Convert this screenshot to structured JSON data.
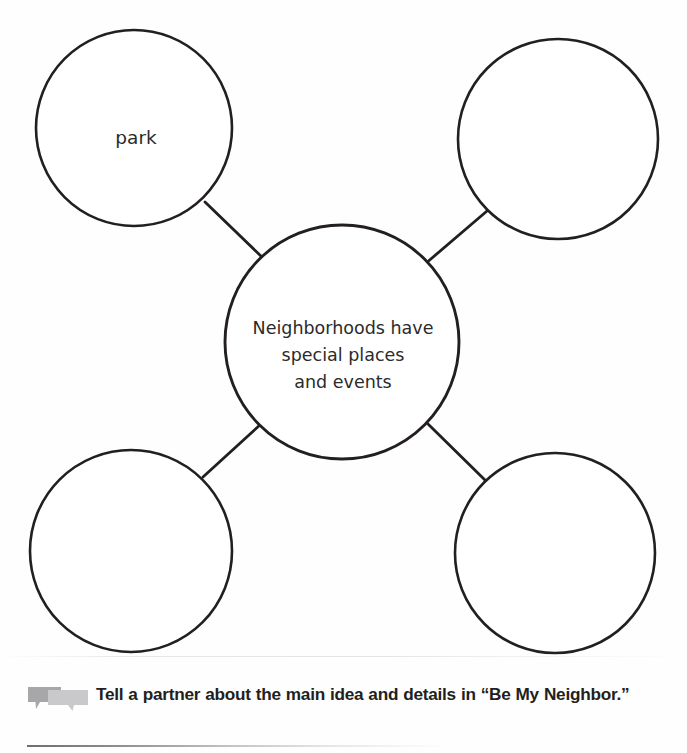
{
  "page": {
    "background_color": "#fefefe",
    "ink_color": "#231f20"
  },
  "diagram": {
    "type": "bubble-map",
    "center": {
      "id": "center-bubble",
      "lines": [
        "Neighborhoods have",
        "special places",
        "and events"
      ],
      "cx": 342,
      "cy": 342,
      "r": 117
    },
    "outer": [
      {
        "id": "bubble-top-left",
        "label": "park",
        "cx": 134,
        "cy": 128,
        "r": 98
      },
      {
        "id": "bubble-top-right",
        "label": "",
        "cx": 558,
        "cy": 139,
        "r": 100
      },
      {
        "id": "bubble-bottom-left",
        "label": "",
        "cx": 131,
        "cy": 551,
        "r": 101
      },
      {
        "id": "bubble-bottom-right",
        "label": "",
        "cx": 555,
        "cy": 553,
        "r": 100
      }
    ],
    "connectors": [
      {
        "id": "connector-top-left",
        "x1": 205,
        "y1": 202,
        "x2": 264,
        "y2": 259
      },
      {
        "id": "connector-top-right",
        "x1": 487,
        "y1": 211,
        "x2": 425,
        "y2": 264
      },
      {
        "id": "connector-bottom-left",
        "x1": 203,
        "y1": 477,
        "x2": 261,
        "y2": 424
      },
      {
        "id": "connector-bottom-right",
        "x1": 486,
        "y1": 481,
        "x2": 428,
        "y2": 424
      }
    ],
    "stroke_color": "#231f20",
    "stroke_width": 2.6
  },
  "footer": {
    "icon": "speech-bubbles-icon",
    "icon_colors": {
      "back": "#a7a7a9",
      "front": "#c9c9cb"
    },
    "instruction": "Tell a partner about the main idea and details in “Be My Neighbor.”",
    "rule_color": "#6e6e72"
  }
}
